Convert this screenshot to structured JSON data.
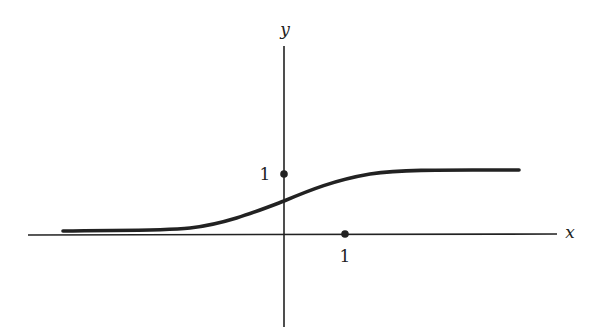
{
  "diagram": {
    "type": "function-graph",
    "axes": {
      "x_label": "x",
      "y_label": "y"
    },
    "marked_points": [
      {
        "name": "y-intercept-one",
        "label": "1",
        "coords": [
          0,
          1
        ]
      },
      {
        "name": "x-one",
        "label": "1",
        "coords": [
          1,
          0
        ]
      }
    ],
    "curve": {
      "y_at_zero": 0.55,
      "left_asymptote": 0.05,
      "right_asymptote": 1.07
    },
    "colors": {
      "background": "#ffffff",
      "ink": "#222222"
    }
  }
}
